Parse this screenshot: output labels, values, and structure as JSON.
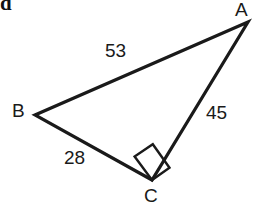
{
  "figure": {
    "type": "right-triangle-diagram",
    "background_color": "#ffffff",
    "stroke_color": "#1a1a1a",
    "text_color": "#1a1a1a",
    "width": 260,
    "height": 204,
    "item_marker": "d",
    "vertices": [
      {
        "name": "A",
        "label": "A",
        "x": 248,
        "y": 22
      },
      {
        "name": "B",
        "label": "B",
        "x": 35,
        "y": 115
      },
      {
        "name": "C",
        "label": "C",
        "x": 152,
        "y": 180
      }
    ],
    "sides": [
      {
        "name": "AB",
        "label": "53",
        "value": 53,
        "from": "A",
        "to": "B"
      },
      {
        "name": "AC",
        "label": "45",
        "value": 45,
        "from": "A",
        "to": "C"
      },
      {
        "name": "BC",
        "label": "28",
        "value": 28,
        "from": "B",
        "to": "C"
      }
    ],
    "right_angle": {
      "at_vertex": "C",
      "marker": "square"
    }
  }
}
